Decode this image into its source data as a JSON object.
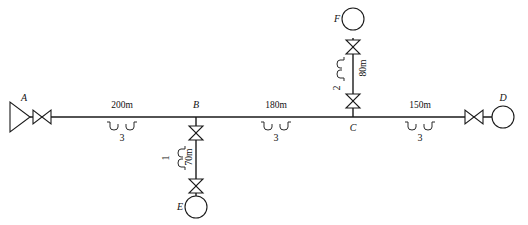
{
  "diagram": {
    "nodes": [
      {
        "id": "A",
        "label": "A",
        "type": "source-reservoir",
        "x": 18,
        "y": 117
      },
      {
        "id": "B",
        "label": "B",
        "type": "junction",
        "x": 196,
        "y": 117
      },
      {
        "id": "C",
        "label": "C",
        "type": "junction",
        "x": 353,
        "y": 117
      },
      {
        "id": "D",
        "label": "D",
        "type": "demand-node",
        "x": 500,
        "y": 117
      },
      {
        "id": "E",
        "label": "E",
        "type": "demand-node",
        "x": 196,
        "y": 205
      },
      {
        "id": "F",
        "label": "F",
        "type": "demand-node",
        "x": 353,
        "y": 18
      }
    ],
    "segments": [
      {
        "id": "AB",
        "from": "A",
        "to": "B",
        "length_label": "200m",
        "diameter_label": "3",
        "orientation": "horizontal"
      },
      {
        "id": "BC",
        "from": "B",
        "to": "C",
        "length_label": "180m",
        "diameter_label": "3",
        "orientation": "horizontal"
      },
      {
        "id": "CD",
        "from": "C",
        "to": "D",
        "length_label": "150m",
        "diameter_label": "3",
        "orientation": "horizontal"
      },
      {
        "id": "BE",
        "from": "B",
        "to": "E",
        "length_label": "70m",
        "diameter_label": "1",
        "orientation": "vertical-down"
      },
      {
        "id": "CF",
        "from": "C",
        "to": "F",
        "length_label": "80m",
        "diameter_label": "2",
        "orientation": "vertical-up"
      }
    ],
    "valves": [
      {
        "id": "valve-A",
        "on_segment": "AB",
        "x": 42,
        "y": 117
      },
      {
        "id": "valve-D",
        "on_segment": "CD",
        "x": 474,
        "y": 117
      },
      {
        "id": "valve-B-branch",
        "on_segment": "BE",
        "x": 196,
        "y": 133
      },
      {
        "id": "valve-E",
        "on_segment": "BE",
        "x": 196,
        "y": 186
      },
      {
        "id": "valve-C-branch",
        "on_segment": "CF",
        "x": 353,
        "y": 101
      },
      {
        "id": "valve-F",
        "on_segment": "CF",
        "x": 353,
        "y": 47
      }
    ]
  }
}
